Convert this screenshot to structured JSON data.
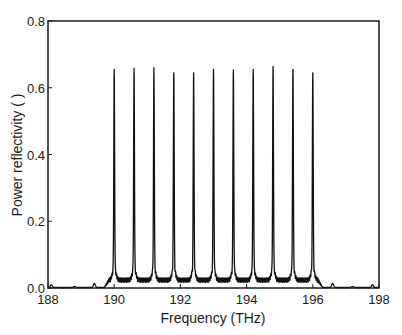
{
  "chart_data": {
    "type": "line",
    "title": "",
    "xlabel": "Frequency (THz)",
    "ylabel": "Power reflectivity ( )",
    "xlim": [
      188,
      198
    ],
    "ylim": [
      0.0,
      0.8
    ],
    "xticks": [
      188,
      190,
      192,
      194,
      196,
      198
    ],
    "xtick_labels": [
      "188",
      "190",
      "192",
      "194",
      "196",
      "198"
    ],
    "yticks": [
      0.0,
      0.2,
      0.4,
      0.6,
      0.8
    ],
    "ytick_labels": [
      "0.0",
      "0.2",
      "0.4",
      "0.6",
      "0.8"
    ],
    "grid": false,
    "legend": null,
    "series": [
      {
        "name": "reflectivity spectrum",
        "color": "#111111",
        "peaks": {
          "x": [
            190.0,
            190.6,
            191.2,
            191.8,
            192.4,
            193.0,
            193.6,
            194.2,
            194.8,
            195.4,
            196.0
          ],
          "y": [
            0.59,
            0.595,
            0.6,
            0.59,
            0.59,
            0.595,
            0.59,
            0.59,
            0.6,
            0.595,
            0.59
          ]
        },
        "baseline_ripple_level": 0.03,
        "side_lobes": {
          "x": [
            188.1,
            188.8,
            189.4,
            196.6,
            197.2,
            197.8
          ],
          "y": [
            0.008,
            0.003,
            0.012,
            0.012,
            0.003,
            0.008
          ]
        }
      }
    ]
  }
}
